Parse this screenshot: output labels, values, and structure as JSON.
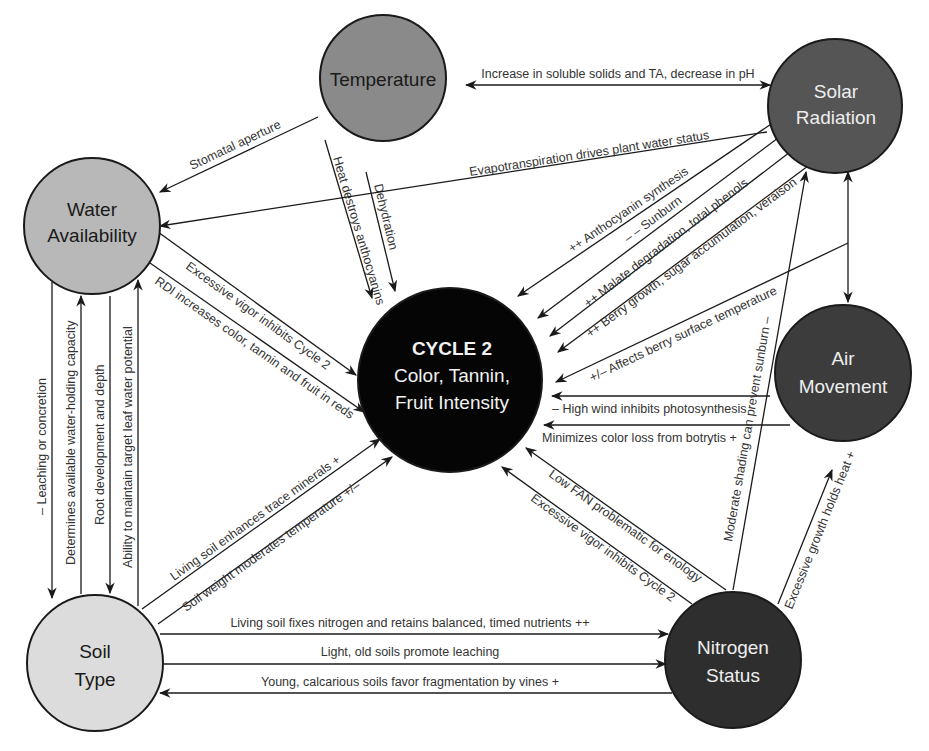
{
  "nodes": {
    "temperature": {
      "lines": [
        "Temperature"
      ],
      "fill": "#8a8a8a",
      "text_color": "#1a1a1a"
    },
    "solar": {
      "lines": [
        "Solar",
        "Radiation"
      ],
      "fill": "#555555",
      "text_color": "#eeeeee"
    },
    "water": {
      "lines": [
        "Water",
        "Availability"
      ],
      "fill": "#b8b8b8",
      "text_color": "#1a1a1a"
    },
    "air": {
      "lines": [
        "Air",
        "Movement"
      ],
      "fill": "#3c3c3c",
      "text_color": "#eeeeee"
    },
    "soil": {
      "lines": [
        "Soil",
        "Type"
      ],
      "fill": "#dcdcdc",
      "text_color": "#1a1a1a"
    },
    "nitrogen": {
      "lines": [
        "Nitrogen",
        "Status"
      ],
      "fill": "#2e2e2e",
      "text_color": "#eeeeee"
    },
    "center": {
      "title": "CYCLE 2",
      "lines": [
        "Color, Tannin,",
        "Fruit Intensity"
      ],
      "fill": "#050505",
      "text_color": "#f2f2f2"
    }
  },
  "edges": {
    "temp_solar": "Increase in soluble solids and TA, decrease in pH",
    "temp_water": "Stomatal aperture",
    "temp_center_heat": "Heat destroys anthocyanins",
    "temp_center_dehyd": "Dehydration",
    "solar_water": "Evapotranspiration drives plant water status",
    "solar_center_antho": "++ Anthocyanin synthesis",
    "solar_center_sunburn": "– – Sunburn",
    "solar_center_malate": "++ Malate degradation, total phenols",
    "solar_center_berry": "++ Berry growth, sugar accumulation, veraison",
    "solar_center_surface": "+/– Affects berry surface temperature",
    "air_center_wind": "– High wind inhibits photosynthesis",
    "air_center_botrytis": "Minimizes color loss from botrytis +",
    "water_center_vigor": "Excessive vigor inhibits Cycle 2",
    "water_center_rdi": "RDI increases color, tannin and fruit in reds",
    "water_soil_leaching": "– Leaching or concretion",
    "soil_water_capacity": "Determines available water-holding capacity",
    "soil_water_root": "Root development and depth",
    "soil_water_ability": "Ability to maintain target leaf water potential",
    "soil_center_living": "Living soil enhances trace minerals +",
    "soil_center_weight": "Soil weight moderates temperature +/–",
    "soil_nitrogen_fixes": "Living soil fixes nitrogen and retains balanced, timed nutrients ++",
    "soil_nitrogen_light": "Light, old soils promote leaching",
    "nitrogen_soil_young": "Young, calcarious soils favor fragmentation by vines +",
    "nitrogen_center_fan": "Low FAN problematic for enology",
    "nitrogen_center_vigor": "Excessive vigor inhibits Cycle 2",
    "nitrogen_solar_shading": "Moderate shading can prevent sunburn –",
    "nitrogen_air_growth": "Excessive growth holds heat +"
  }
}
